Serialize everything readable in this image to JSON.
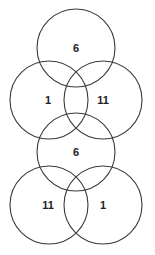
{
  "diagram": {
    "type": "venn-stack",
    "stroke_color": "#3a3a3a",
    "label_color": "#222222",
    "upper_group": {
      "top": {
        "label": "6",
        "cx": 76,
        "cy": 48,
        "r": 39
      },
      "left": {
        "label": "1",
        "cx": 49,
        "cy": 100,
        "r": 39
      },
      "right": {
        "label": "11",
        "cx": 103,
        "cy": 100,
        "r": 39
      }
    },
    "lower_group": {
      "top": {
        "label": "6",
        "cx": 76,
        "cy": 152,
        "r": 39
      },
      "left": {
        "label": "11",
        "cx": 49,
        "cy": 205,
        "r": 39
      },
      "right": {
        "label": "1",
        "cx": 103,
        "cy": 205,
        "r": 39
      }
    }
  }
}
